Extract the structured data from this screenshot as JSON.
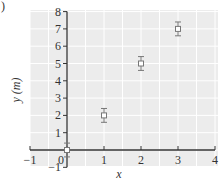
{
  "panel_label": ")",
  "chart_data": {
    "type": "scatter",
    "title": "",
    "xlabel": "x",
    "ylabel": "y (m)",
    "xlim": [
      -1,
      4
    ],
    "ylim": [
      -1,
      8
    ],
    "x_ticks": [
      -1,
      0,
      1,
      2,
      3,
      4
    ],
    "y_ticks": [
      -1,
      0,
      1,
      2,
      3,
      4,
      5,
      6,
      7,
      8
    ],
    "x_tick_labels": [
      "−1",
      "0",
      "1",
      "2",
      "3",
      "4"
    ],
    "y_tick_labels": [
      "−1",
      "0",
      "1",
      "2",
      "3",
      "4",
      "5",
      "6",
      "7",
      "8"
    ],
    "grid": true,
    "legend": null,
    "series": [
      {
        "name": "data",
        "marker": "open-square",
        "points": [
          {
            "x": 0,
            "y": 0,
            "yerr": 0.4
          },
          {
            "x": 1,
            "y": 2,
            "yerr": 0.4
          },
          {
            "x": 2,
            "y": 5,
            "yerr": 0.4
          },
          {
            "x": 3,
            "y": 7,
            "yerr": 0.4
          }
        ]
      }
    ]
  },
  "colors": {
    "plot_background": "#ececec",
    "grid": "#ffffff",
    "axis": "#333333",
    "marker": "#777777"
  }
}
